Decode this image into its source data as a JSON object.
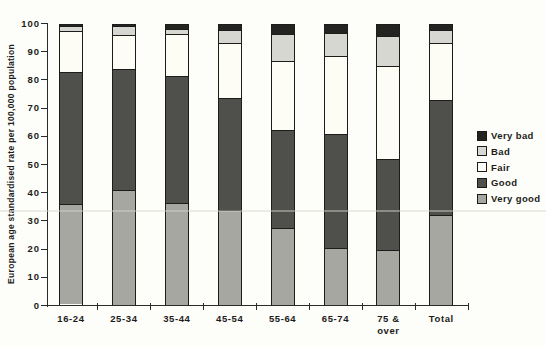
{
  "chart_data": {
    "type": "bar",
    "stacked": true,
    "title": "",
    "xlabel": "",
    "ylabel": "European age standardised rate per 100,000 population",
    "ylim": [
      0,
      100
    ],
    "yticks": [
      0,
      10,
      20,
      30,
      40,
      50,
      60,
      70,
      80,
      90,
      100
    ],
    "grid": false,
    "categories": [
      "16-24",
      "25-34",
      "35-44",
      "45-54",
      "55-64",
      "65-74",
      "75 &\nover",
      "Total"
    ],
    "series": [
      {
        "name": "Very good",
        "color": "#a7a7a2",
        "values": [
          36,
          41,
          36.5,
          34,
          27.5,
          20,
          19.5,
          32
        ]
      },
      {
        "name": "Good",
        "color": "#4f4f4c",
        "values": [
          47.5,
          43.5,
          45.5,
          40,
          35,
          41,
          32.5,
          41.5
        ]
      },
      {
        "name": "Fair",
        "color": "#fdfdf6",
        "values": [
          14.5,
          12,
          15,
          19.5,
          24.5,
          28,
          33.5,
          20
        ]
      },
      {
        "name": "Bad",
        "color": "#d7d7d1",
        "values": [
          1.5,
          3,
          1.5,
          4.5,
          9.5,
          8,
          10.5,
          4.5
        ]
      },
      {
        "name": "Very bad",
        "color": "#232321",
        "values": [
          0.5,
          0.5,
          1.5,
          2,
          3.5,
          3,
          4,
          2
        ]
      }
    ],
    "legend": {
      "position": "right",
      "entries": [
        "Very bad",
        "Bad",
        "Fair",
        "Good",
        "Very good"
      ]
    },
    "axis_color": "#2a2a28"
  }
}
